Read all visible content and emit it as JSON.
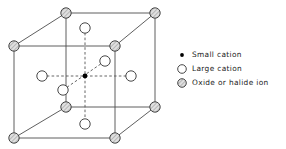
{
  "figure": {
    "kind": "perovskite-unit-cell-diagram",
    "colors": {
      "line": "#4d4d4d",
      "dashed": "#555555",
      "small_cation_fill": "#000000",
      "large_cation_fill": "#ffffff",
      "large_cation_stroke": "#333333",
      "oxide_fill": "#d9d9d9",
      "oxide_stroke": "#333333",
      "text": "#1a1a1a",
      "background": "#ffffff"
    },
    "geometry": {
      "front_top_left": [
        14,
        46
      ],
      "front_top_right": [
        115,
        46
      ],
      "front_bottom_left": [
        14,
        138
      ],
      "front_bottom_right": [
        115,
        138
      ],
      "back_top_left": [
        66,
        13
      ],
      "back_top_right": [
        155,
        13
      ],
      "back_bottom_left": [
        66,
        107
      ],
      "back_bottom_right": [
        155,
        107
      ],
      "center": [
        85,
        76
      ],
      "corner_radius": 5.2,
      "large_cation_radius": 5.2,
      "small_cation_radius": 2.4
    },
    "corner_ions": [
      {
        "name": "corner-front-top-left",
        "x": 14,
        "y": 46
      },
      {
        "name": "corner-front-top-right",
        "x": 115,
        "y": 46
      },
      {
        "name": "corner-front-bottom-left",
        "x": 14,
        "y": 138
      },
      {
        "name": "corner-front-bottom-right",
        "x": 115,
        "y": 138
      },
      {
        "name": "corner-back-top-left",
        "x": 66,
        "y": 13
      },
      {
        "name": "corner-back-top-right",
        "x": 155,
        "y": 13
      },
      {
        "name": "corner-back-bottom-left",
        "x": 66,
        "y": 107
      },
      {
        "name": "corner-back-bottom-right",
        "x": 155,
        "y": 107
      }
    ],
    "large_cations": [
      {
        "name": "large-cation-top-face",
        "x": 85,
        "y": 28
      },
      {
        "name": "large-cation-bottom-face",
        "x": 85,
        "y": 124
      },
      {
        "name": "large-cation-left-face",
        "x": 42,
        "y": 76
      },
      {
        "name": "large-cation-right-face",
        "x": 131,
        "y": 76
      },
      {
        "name": "large-cation-back-face",
        "x": 105,
        "y": 61
      },
      {
        "name": "large-cation-front-face",
        "x": 63,
        "y": 90
      }
    ],
    "small_cation": {
      "name": "small-cation-body-center",
      "x": 85,
      "y": 76
    }
  },
  "legend": {
    "items": [
      {
        "marker": "small-filled-dot-icon",
        "label": "Small cation"
      },
      {
        "marker": "large-open-circle-icon",
        "label": "Large cation"
      },
      {
        "marker": "hatched-circle-icon",
        "label": "Oxide or halide ion"
      }
    ]
  }
}
